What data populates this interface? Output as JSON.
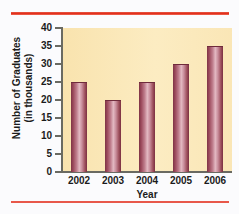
{
  "chart_data": {
    "type": "bar",
    "title": "",
    "categories": [
      "2002",
      "2003",
      "2004",
      "2005",
      "2006"
    ],
    "values": [
      25,
      20,
      25,
      30,
      35
    ],
    "xlabel": "Year",
    "ylabel_line1": "Number of Graduates",
    "ylabel_line2": "(in thousands)",
    "ylabel": "Number of Graduates (in thousands)",
    "ylim": [
      0,
      40
    ],
    "yticks": [
      40,
      35,
      30,
      25,
      20,
      15,
      10,
      5,
      0
    ],
    "ytick_labels": [
      "40",
      "35",
      "30",
      "25",
      "20",
      "15",
      "10",
      "5",
      "0"
    ],
    "grid": false,
    "legend": null,
    "bar_color": "#b26374",
    "plot_background": "#fae6b6",
    "rule_color": "#e02a18"
  }
}
